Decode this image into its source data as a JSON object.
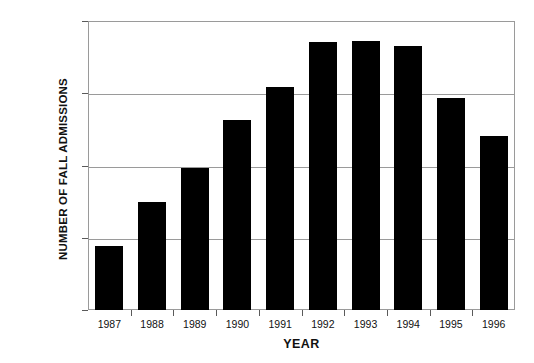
{
  "chart_data": {
    "type": "bar",
    "title": "",
    "xlabel": "YEAR",
    "ylabel": "NUMBER OF FALL ADMISSIONS",
    "categories": [
      "1987",
      "1988",
      "1989",
      "1990",
      "1991",
      "1992",
      "1993",
      "1994",
      "1995",
      "1996"
    ],
    "values": [
      68800,
      75000,
      79700,
      86300,
      90800,
      97100,
      97200,
      96500,
      89300,
      84100
    ],
    "ylim": [
      60000,
      100000
    ],
    "ytick_labels": [
      "100,000",
      "90,000",
      "80,000",
      "70,000",
      "60,000"
    ],
    "ytick_values": [
      100000,
      90000,
      80000,
      70000,
      60000
    ],
    "grid": "horizontal",
    "legend": "none",
    "bar_color": "#000000",
    "grid_color": "#9a9a9a",
    "background_color": "#ffffff"
  }
}
